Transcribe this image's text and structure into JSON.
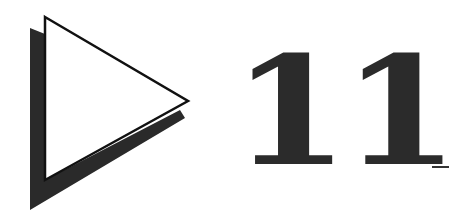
{
  "logo": {
    "icon": "play-triangle-icon",
    "fill_color": "#ffffff",
    "outline_color": "#111111",
    "shadow_color": "#2a2a2a"
  },
  "heading": {
    "number": "11",
    "text_color": "#2b2b2b"
  },
  "cursor": {
    "glyph": "_"
  }
}
